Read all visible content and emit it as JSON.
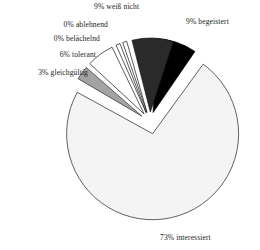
{
  "chart_data": {
    "type": "pie",
    "title": "",
    "subtitle": "",
    "xlabel": "",
    "ylabel": "",
    "legend_position": "none",
    "grid": false,
    "units": "percent",
    "total": 100,
    "categories": [
      "interessiert",
      "begeistert",
      "weiß nicht",
      "ablehnend",
      "belächelnd",
      "tolerant",
      "gleichgültig"
    ],
    "values": [
      73,
      9,
      9,
      0,
      0,
      6,
      3
    ],
    "slices": [
      {
        "label": "73% interessiert",
        "category": "interessiert",
        "value": 73,
        "value_text": "73%",
        "color": "#f4f4f4",
        "stroke": "#3a3a3a",
        "exploded": true
      },
      {
        "label": "9% begeistert",
        "category": "begeistert",
        "value": 9,
        "value_text": "9%",
        "color": "#000000",
        "stroke": "#000000",
        "exploded": true
      },
      {
        "label": "9% weiß nicht",
        "category": "weiß nicht",
        "value": 9,
        "value_text": "9%",
        "color": "#2a2a2a",
        "stroke": "#141414",
        "exploded": true
      },
      {
        "label": "0% ablehnend",
        "category": "ablehnend",
        "value": 0,
        "value_text": "0%",
        "color": "#ffffff",
        "stroke": "#161616",
        "exploded": true
      },
      {
        "label": "0% belächelnd",
        "category": "belächelnd",
        "value": 0,
        "value_text": "0%",
        "color": "#ffffff",
        "stroke": "#161616",
        "exploded": true
      },
      {
        "label": "6% tolerant",
        "category": "tolerant",
        "value": 6,
        "value_text": "6%",
        "color": "#ffffff",
        "stroke": "#161616",
        "exploded": true
      },
      {
        "label": "3% gleichgültig",
        "category": "gleichgültig",
        "value": 3,
        "value_text": "3%",
        "color": "#a3a3a3",
        "stroke": "#2b2b2b",
        "exploded": true
      }
    ]
  },
  "labels": {
    "weiss_nicht": "9% weiß nicht",
    "begeistert": "9% begeistert",
    "ablehnend": "0% ablehnend",
    "belaechelnd": "0% belächelnd",
    "tolerant": "6% tolerant",
    "gleichgueltig": "3% gleichgültig",
    "interessiert": "73% interessiert"
  },
  "colors": {
    "background": "#ffffff",
    "text": "#1c1c1c",
    "slice_black": "#000000",
    "slice_charcoal": "#2a2a2a",
    "slice_gray": "#a3a3a3",
    "slice_white": "#ffffff",
    "slice_offwhite": "#f4f4f4",
    "outline": "#2b2b2b"
  }
}
